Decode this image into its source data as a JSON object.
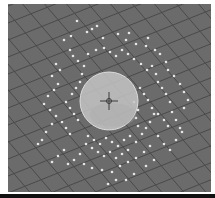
{
  "viewport": {
    "background": "#6b6b6b",
    "grid_color": "#4a4a4a",
    "sphere": {
      "cx": 101,
      "cy": 97,
      "r": 29,
      "fill": "#c4c4c4",
      "stroke": "#dcdcdc"
    },
    "pivot": {
      "cx": 101,
      "cy": 97,
      "size": 9,
      "color": "#3a3a3a"
    },
    "particle_color": "#e6e6e6",
    "particles": [
      [
        69,
        17
      ],
      [
        84,
        25
      ],
      [
        89,
        22
      ],
      [
        79,
        28
      ],
      [
        63,
        32
      ],
      [
        56,
        36
      ],
      [
        95,
        34
      ],
      [
        110,
        30
      ],
      [
        121,
        29
      ],
      [
        118,
        36
      ],
      [
        128,
        40
      ],
      [
        138,
        42
      ],
      [
        140,
        34
      ],
      [
        147,
        46
      ],
      [
        152,
        50
      ],
      [
        158,
        58
      ],
      [
        160,
        66
      ],
      [
        166,
        72
      ],
      [
        172,
        80
      ],
      [
        176,
        88
      ],
      [
        62,
        46
      ],
      [
        65,
        52
      ],
      [
        70,
        57
      ],
      [
        76,
        62
      ],
      [
        80,
        50
      ],
      [
        88,
        46
      ],
      [
        96,
        44
      ],
      [
        102,
        48
      ],
      [
        108,
        52
      ],
      [
        114,
        46
      ],
      [
        120,
        50
      ],
      [
        126,
        55
      ],
      [
        133,
        60
      ],
      [
        139,
        66
      ],
      [
        144,
        62
      ],
      [
        148,
        70
      ],
      [
        150,
        78
      ],
      [
        154,
        84
      ],
      [
        158,
        90
      ],
      [
        162,
        98
      ],
      [
        48,
        60
      ],
      [
        52,
        66
      ],
      [
        44,
        72
      ],
      [
        50,
        80
      ],
      [
        46,
        86
      ],
      [
        40,
        92
      ],
      [
        36,
        100
      ],
      [
        42,
        106
      ],
      [
        48,
        112
      ],
      [
        54,
        118
      ],
      [
        58,
        124
      ],
      [
        62,
        130
      ],
      [
        44,
        120
      ],
      [
        38,
        128
      ],
      [
        34,
        136
      ],
      [
        30,
        140
      ],
      [
        58,
        98
      ],
      [
        62,
        104
      ],
      [
        66,
        110
      ],
      [
        70,
        116
      ],
      [
        64,
        90
      ],
      [
        68,
        84
      ],
      [
        72,
        78
      ],
      [
        74,
        70
      ],
      [
        132,
        84
      ],
      [
        136,
        90
      ],
      [
        140,
        96
      ],
      [
        144,
        104
      ],
      [
        146,
        110
      ],
      [
        142,
        118
      ],
      [
        138,
        124
      ],
      [
        134,
        130
      ],
      [
        130,
        122
      ],
      [
        128,
        114
      ],
      [
        130,
        106
      ],
      [
        126,
        98
      ],
      [
        150,
        110
      ],
      [
        156,
        116
      ],
      [
        160,
        122
      ],
      [
        164,
        108
      ],
      [
        168,
        116
      ],
      [
        172,
        124
      ],
      [
        176,
        104
      ],
      [
        180,
        96
      ],
      [
        80,
        132
      ],
      [
        86,
        136
      ],
      [
        92,
        140
      ],
      [
        98,
        134
      ],
      [
        104,
        138
      ],
      [
        110,
        142
      ],
      [
        116,
        136
      ],
      [
        122,
        132
      ],
      [
        128,
        138
      ],
      [
        120,
        146
      ],
      [
        114,
        150
      ],
      [
        108,
        154
      ],
      [
        102,
        148
      ],
      [
        96,
        152
      ],
      [
        90,
        148
      ],
      [
        84,
        144
      ],
      [
        78,
        140
      ],
      [
        72,
        150
      ],
      [
        66,
        156
      ],
      [
        60,
        160
      ],
      [
        76,
        160
      ],
      [
        84,
        164
      ],
      [
        94,
        166
      ],
      [
        104,
        168
      ],
      [
        112,
        162
      ],
      [
        120,
        158
      ],
      [
        128,
        154
      ],
      [
        136,
        148
      ],
      [
        142,
        142
      ],
      [
        146,
        156
      ],
      [
        138,
        162
      ],
      [
        126,
        170
      ],
      [
        118,
        176
      ],
      [
        108,
        176
      ],
      [
        100,
        180
      ],
      [
        56,
        146
      ],
      [
        50,
        152
      ],
      [
        44,
        158
      ],
      [
        150,
        132
      ],
      [
        156,
        140
      ],
      [
        162,
        146
      ],
      [
        168,
        136
      ],
      [
        174,
        128
      ]
    ]
  }
}
